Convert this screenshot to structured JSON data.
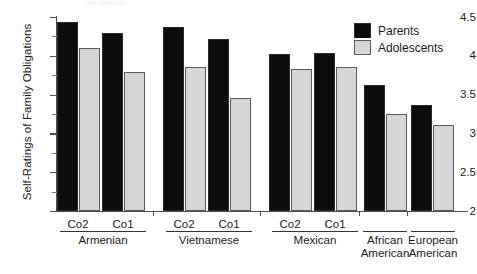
{
  "figure": {
    "cropped_top_text": "conclusions.",
    "ylabel": "Self-Ratings of Family Obligations"
  },
  "legend": {
    "items": [
      {
        "label": "Parents",
        "color": "#0d0d0d",
        "icon": "legend-swatch-parents"
      },
      {
        "label": "Adolescents",
        "color": "#d6d6d6",
        "icon": "legend-swatch-adolescents"
      }
    ]
  },
  "axis": {
    "y_ticks": [
      "2",
      "2.5",
      "3",
      "3.5",
      "4",
      "4.5"
    ],
    "y_min": 2,
    "y_max": 4.5
  },
  "categories": [
    {
      "tick": "Co2",
      "group": "Armenian"
    },
    {
      "tick": "Co1",
      "group": "Armenian"
    },
    {
      "tick": "Co2",
      "group": "Vietnamese"
    },
    {
      "tick": "Co1",
      "group": "Vietnamese"
    },
    {
      "tick": "Co2",
      "group": "Mexican"
    },
    {
      "tick": "Co1",
      "group": "Mexican"
    },
    {
      "tick": "",
      "group": "African American"
    },
    {
      "tick": "",
      "group": "European American"
    }
  ],
  "groups": [
    {
      "label": "Armenian",
      "line1": "Armenian",
      "line2": ""
    },
    {
      "label": "Vietnamese",
      "line1": "Vietnamese",
      "line2": ""
    },
    {
      "label": "Mexican",
      "line1": "Mexican",
      "line2": ""
    },
    {
      "label": "African American",
      "line1": "African",
      "line2": "American"
    },
    {
      "label": "European American",
      "line1": "European",
      "line2": "American"
    }
  ],
  "chart_data": {
    "type": "bar",
    "title": "",
    "xlabel": "",
    "ylabel": "Self-Ratings of Family Obligations",
    "ylim": [
      2,
      4.5
    ],
    "ytick_step": 0.5,
    "yminor_step": 0.25,
    "grid": false,
    "legend_position": "top-right",
    "categories": [
      "Armenian Co2",
      "Armenian Co1",
      "Vietnamese Co2",
      "Vietnamese Co1",
      "Mexican Co2",
      "Mexican Co1",
      "African American",
      "European American"
    ],
    "series": [
      {
        "name": "Parents",
        "color": "#0d0d0d",
        "values": [
          4.44,
          4.3,
          4.37,
          4.22,
          4.02,
          4.03,
          3.62,
          3.37
        ]
      },
      {
        "name": "Adolescents",
        "color": "#d6d6d6",
        "values": [
          4.1,
          3.79,
          3.86,
          3.45,
          3.83,
          3.86,
          3.25,
          3.11
        ]
      }
    ]
  }
}
